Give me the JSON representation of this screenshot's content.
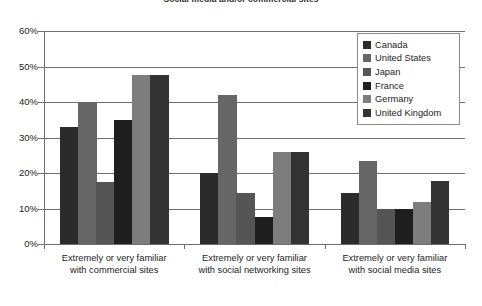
{
  "chart_data": {
    "type": "bar",
    "title": "Social media and/or commercial sites",
    "xlabel": "",
    "ylabel": "",
    "ylim": [
      0,
      60
    ],
    "ytick_labels": [
      "0%",
      "10%",
      "20%",
      "30%",
      "40%",
      "50%",
      "60%"
    ],
    "ytick_values": [
      0,
      10,
      20,
      30,
      40,
      50,
      60
    ],
    "grid": true,
    "legend_position": "top-right",
    "categories": [
      "Extremely or very familiar\nwith commercial sites",
      "Extremely or very familiar\nwith social networking sites",
      "Extremely or very familiar\nwith social media sites"
    ],
    "category_lines": [
      [
        "Extremely or very familiar",
        "with commercial sites"
      ],
      [
        "Extremely or very familiar",
        "with social networking sites"
      ],
      [
        "Extremely or very familiar",
        "with social media sites"
      ]
    ],
    "series": [
      {
        "name": "Canada",
        "color": "#2b2b2b",
        "values": [
          33.0,
          20.0,
          14.5
        ]
      },
      {
        "name": "United States",
        "color": "#666666",
        "values": [
          40.0,
          42.0,
          23.5
        ]
      },
      {
        "name": "Japan",
        "color": "#555555",
        "values": [
          17.5,
          14.5,
          10.0
        ]
      },
      {
        "name": "France",
        "color": "#1f1f1f",
        "values": [
          35.0,
          7.5,
          10.0
        ]
      },
      {
        "name": "Germany",
        "color": "#7d7d7d",
        "values": [
          47.5,
          26.0,
          11.8
        ]
      },
      {
        "name": "United Kingdom",
        "color": "#333333",
        "values": [
          47.5,
          26.0,
          17.8
        ]
      }
    ]
  }
}
